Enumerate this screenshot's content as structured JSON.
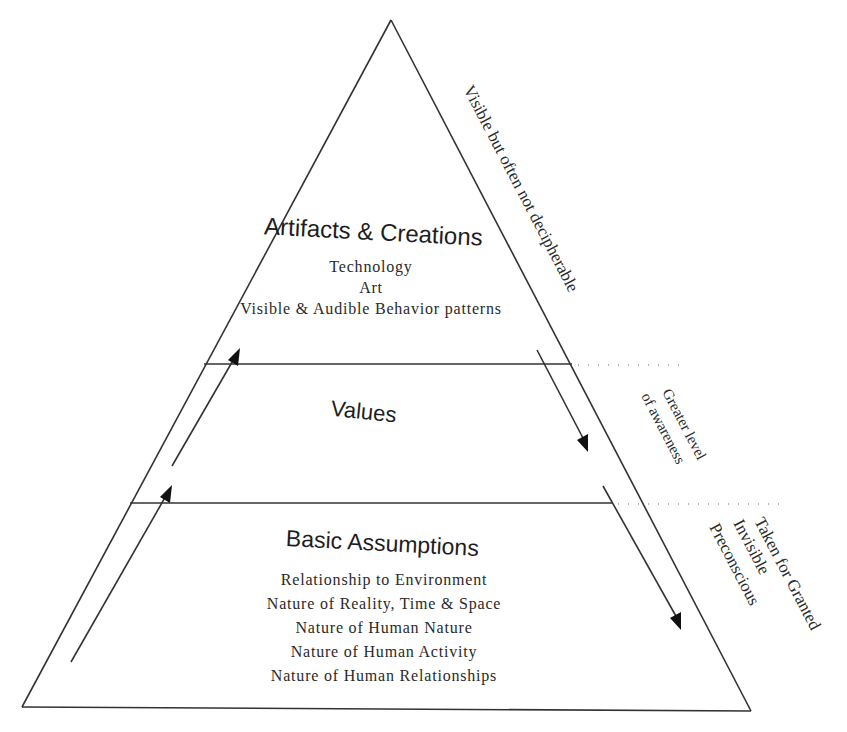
{
  "diagram": {
    "type": "pyramid",
    "layers": [
      {
        "title": "Artifacts & Creations",
        "items": [
          "Technology",
          "Art",
          "Visible & Audible Behavior patterns"
        ],
        "side_label": [
          "Visible but often not decipherable"
        ]
      },
      {
        "title": "Values",
        "items": [],
        "side_label": [
          "Greater level",
          "of awareness"
        ]
      },
      {
        "title": "Basic Assumptions",
        "items": [
          "Relationship to Environment",
          "Nature of Reality, Time & Space",
          "Nature of Human Nature",
          "Nature of Human Activity",
          "Nature of Human Relationships"
        ],
        "side_label": [
          "Taken for Granted",
          "Invisible",
          "Preconscious"
        ]
      }
    ],
    "arrows": {
      "left": "upward (from basic assumptions to artifacts)",
      "right": "downward (from artifacts to basic assumptions)"
    },
    "colors": {
      "line": "#333333",
      "text": "#1e1e1e",
      "background": "#ffffff"
    }
  }
}
